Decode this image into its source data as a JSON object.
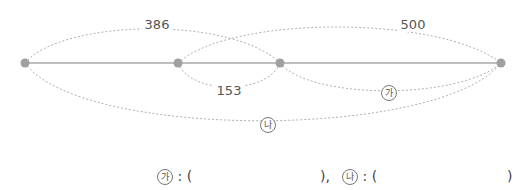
{
  "diagram": {
    "points": [
      {
        "x": 25,
        "y": 63
      },
      {
        "x": 178,
        "y": 63
      },
      {
        "x": 280,
        "y": 63
      },
      {
        "x": 501,
        "y": 63
      }
    ],
    "labels": {
      "top_left_arc": "386",
      "top_right_arc": "500",
      "inner_bottom_arc": "153",
      "lower_right_arc": "가",
      "bottom_arc": "나"
    },
    "colors": {
      "point": "#a0a0a0",
      "line": "#a8a8a8",
      "dashed": "#b0b0b0",
      "text": "#555555"
    }
  },
  "answer": {
    "a_symbol": "가",
    "b_symbol": "나",
    "colon": ":",
    "open": "(",
    "close_a": "),",
    "close_b": ")"
  }
}
